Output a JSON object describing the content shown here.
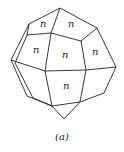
{
  "figure": {
    "caption": "(a)",
    "face_label": "n",
    "stroke_color": "#222222",
    "background": "#ffffff"
  },
  "faces": [
    {
      "id": "top-left-face",
      "label": "n"
    },
    {
      "id": "top-right-face",
      "label": "n"
    },
    {
      "id": "middle-left-face",
      "label": "n"
    },
    {
      "id": "center-face",
      "label": "n"
    },
    {
      "id": "middle-right-face",
      "label": "n"
    },
    {
      "id": "bottom-center-face",
      "label": "n"
    }
  ]
}
